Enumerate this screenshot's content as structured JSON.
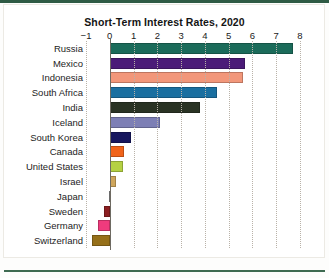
{
  "page": {
    "background_color": "#ffffff",
    "rule_color": "#2f5b45"
  },
  "chart_data": {
    "type": "bar",
    "orientation": "horizontal",
    "title": "Short-Term Interest Rates, 2020",
    "xlabel": "",
    "ylabel": "",
    "xlim": [
      -1,
      8
    ],
    "xticks": [
      -1,
      0,
      1,
      2,
      3,
      4,
      5,
      6,
      7,
      8
    ],
    "xtick_labels": [
      "−1",
      "0",
      "1",
      "2",
      "3",
      "4",
      "5",
      "6",
      "7",
      "8"
    ],
    "grid": "vertical-dotted",
    "legend": "none",
    "categories": [
      "Russia",
      "Mexico",
      "Indonesia",
      "South Africa",
      "India",
      "Iceland",
      "South Korea",
      "Canada",
      "United States",
      "Israel",
      "Japan",
      "Sweden",
      "Germany",
      "Switzerland"
    ],
    "values": [
      7.7,
      5.7,
      5.6,
      4.5,
      3.8,
      2.1,
      0.9,
      0.6,
      0.55,
      0.25,
      -0.05,
      -0.25,
      -0.5,
      -0.75
    ],
    "colors": [
      "#1b6b5a",
      "#4b1b78",
      "#f2977a",
      "#1a6fa0",
      "#2a3324",
      "#7d7fb5",
      "#17175e",
      "#f0631a",
      "#b5d143",
      "#cfa65c",
      "#8a8a8a",
      "#8c1f22",
      "#ef3b7d",
      "#96701a"
    ]
  }
}
